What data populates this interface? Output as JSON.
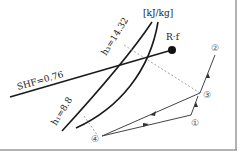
{
  "diagram": {
    "unit_label": "[kJ/kg]",
    "shf_label": "SHF=0.76",
    "h3_label": "h₃=14.32",
    "h1_label": "h₁=8.8",
    "rf_label": "R·f",
    "points": {
      "p1": "①",
      "p2": "②",
      "p3": "③",
      "p4": "④"
    },
    "colors": {
      "line": "#1a1a1a",
      "process_line": "#444444",
      "dashed": "#888888",
      "border": "#9a9a9a"
    }
  }
}
